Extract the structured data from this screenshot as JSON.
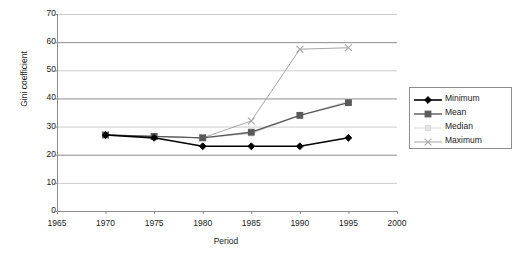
{
  "chart_data": {
    "type": "line",
    "title": "",
    "subtitle": "",
    "xlabel": "Period",
    "ylabel": "Gini coefficient",
    "x": [
      1970,
      1975,
      1980,
      1985,
      1990,
      1995
    ],
    "xlim": [
      1965,
      2000
    ],
    "ylim": [
      0,
      70
    ],
    "xticks": [
      "1965",
      "1970",
      "1975",
      "1980",
      "1985",
      "1990",
      "1995",
      "2000"
    ],
    "xtick_values": [
      1965,
      1970,
      1975,
      1980,
      1985,
      1990,
      1995,
      2000
    ],
    "yticks": [
      "0",
      "10",
      "20",
      "30",
      "40",
      "50",
      "60",
      "70"
    ],
    "ytick_values": [
      0,
      10,
      20,
      30,
      40,
      50,
      60,
      70
    ],
    "grid": "horizontal",
    "legend_position": "right",
    "series": [
      {
        "name": "Minimum",
        "values": [
          27,
          26,
          23,
          23,
          23,
          26
        ],
        "color": "#000000",
        "marker": "diamond",
        "marker_fill": "#000000",
        "line_width": 1.6
      },
      {
        "name": "Mean",
        "values": [
          27,
          26.5,
          26,
          28,
          34,
          38.5
        ],
        "color": "#595959",
        "marker": "square",
        "marker_fill": "#595959",
        "line_width": 1.4
      },
      {
        "name": "Median",
        "values": [
          27,
          26.5,
          26,
          27.5,
          34,
          39
        ],
        "color": "#d9d9d9",
        "marker": "square-small",
        "marker_fill": "#e6e6e6",
        "line_width": 1.0
      },
      {
        "name": "Maximum",
        "values": [
          27,
          26.5,
          26,
          32,
          57.5,
          58
        ],
        "color": "#a6a6a6",
        "marker": "cross",
        "marker_fill": "#a6a6a6",
        "line_width": 1.0
      }
    ]
  },
  "legend": {
    "entries": [
      {
        "label": "Minimum"
      },
      {
        "label": "Mean"
      },
      {
        "label": "Median"
      },
      {
        "label": "Maximum"
      }
    ]
  },
  "style": {
    "background": "#ffffff",
    "axis_color": "#8c8c8c",
    "gridline_color": "#a6a6a6",
    "text_color": "#1a1a1a"
  }
}
